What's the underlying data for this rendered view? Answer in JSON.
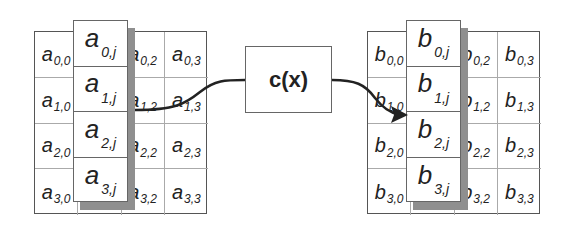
{
  "diagram": {
    "input_matrix": {
      "name": "a",
      "rows": [
        [
          {
            "sym": "a",
            "sub": "0,0"
          },
          {
            "sym": "a",
            "sub": "0,1"
          },
          {
            "sym": "a",
            "sub": "0,2"
          },
          {
            "sym": "a",
            "sub": "0,3"
          }
        ],
        [
          {
            "sym": "a",
            "sub": "1,0"
          },
          {
            "sym": "a",
            "sub": "1,1"
          },
          {
            "sym": "a",
            "sub": "1,2"
          },
          {
            "sym": "a",
            "sub": "1,3"
          }
        ],
        [
          {
            "sym": "a",
            "sub": "2,0"
          },
          {
            "sym": "a",
            "sub": "2,1"
          },
          {
            "sym": "a",
            "sub": "2,2"
          },
          {
            "sym": "a",
            "sub": "2,3"
          }
        ],
        [
          {
            "sym": "a",
            "sub": "3,0"
          },
          {
            "sym": "a",
            "sub": "3,1"
          },
          {
            "sym": "a",
            "sub": "3,2"
          },
          {
            "sym": "a",
            "sub": "3,3"
          }
        ]
      ],
      "column": [
        {
          "sym": "a",
          "sub": "0,j"
        },
        {
          "sym": "a",
          "sub": "1,j"
        },
        {
          "sym": "a",
          "sub": "2,j"
        },
        {
          "sym": "a",
          "sub": "3,j"
        }
      ]
    },
    "function": {
      "label": "c(x)"
    },
    "output_matrix": {
      "name": "b",
      "rows": [
        [
          {
            "sym": "b",
            "sub": "0,0"
          },
          {
            "sym": "b",
            "sub": "0,1"
          },
          {
            "sym": "b",
            "sub": "0,2"
          },
          {
            "sym": "b",
            "sub": "0,3"
          }
        ],
        [
          {
            "sym": "b",
            "sub": "1,0"
          },
          {
            "sym": "b",
            "sub": "1,1"
          },
          {
            "sym": "b",
            "sub": "1,2"
          },
          {
            "sym": "b",
            "sub": "1,3"
          }
        ],
        [
          {
            "sym": "b",
            "sub": "2,0"
          },
          {
            "sym": "b",
            "sub": "2,1"
          },
          {
            "sym": "b",
            "sub": "2,2"
          },
          {
            "sym": "b",
            "sub": "2,3"
          }
        ],
        [
          {
            "sym": "b",
            "sub": "3,0"
          },
          {
            "sym": "b",
            "sub": "3,1"
          },
          {
            "sym": "b",
            "sub": "3,2"
          },
          {
            "sym": "b",
            "sub": "3,3"
          }
        ]
      ],
      "column": [
        {
          "sym": "b",
          "sub": "0,j"
        },
        {
          "sym": "b",
          "sub": "1,j"
        },
        {
          "sym": "b",
          "sub": "2,j"
        },
        {
          "sym": "b",
          "sub": "3,j"
        }
      ]
    },
    "colors": {
      "line": "#222222",
      "shadow": "#8f8f8f",
      "grid": "#aaaaaa"
    }
  }
}
